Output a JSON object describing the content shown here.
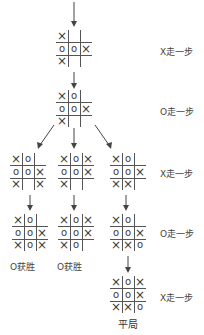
{
  "step_labels": [
    "X走一步",
    "O走一步",
    "X走一步",
    "O走一步",
    "X走一步"
  ],
  "boards": {
    "level1": [
      [
        "X",
        "",
        ""
      ],
      [
        "O",
        "O",
        "X"
      ],
      [
        "X",
        "",
        ""
      ]
    ],
    "level2": [
      [
        "X",
        "O",
        ""
      ],
      [
        "O",
        "O",
        "X"
      ],
      [
        "X",
        "",
        ""
      ]
    ],
    "level3_left": [
      [
        "X",
        "O",
        ""
      ],
      [
        "O",
        "O",
        "X"
      ],
      [
        "X",
        "",
        "X"
      ]
    ],
    "level3_mid": [
      [
        "X",
        "O",
        "X"
      ],
      [
        "O",
        "O",
        "X"
      ],
      [
        "X",
        "",
        ""
      ]
    ],
    "level3_right": [
      [
        "X",
        "O",
        ""
      ],
      [
        "O",
        "O",
        "X"
      ],
      [
        "X",
        "X",
        ""
      ]
    ],
    "level4_left": [
      [
        "X",
        "O",
        ""
      ],
      [
        "O",
        "O",
        "X"
      ],
      [
        "X",
        "O",
        "X"
      ]
    ],
    "level4_mid": [
      [
        "X",
        "O",
        "X"
      ],
      [
        "O",
        "O",
        "X"
      ],
      [
        "X",
        "O",
        ""
      ]
    ],
    "level4_right": [
      [
        "X",
        "O",
        ""
      ],
      [
        "O",
        "O",
        "X"
      ],
      [
        "X",
        "X",
        "O"
      ]
    ],
    "level5": [
      [
        "X",
        "O",
        "X"
      ],
      [
        "O",
        "O",
        "X"
      ],
      [
        "X",
        "X",
        "O"
      ]
    ]
  },
  "outcomes": {
    "left": "O获胜",
    "mid": "O获胜",
    "final": "平局"
  },
  "colors": {
    "line": "#555555",
    "text": "#3a3a3a"
  }
}
